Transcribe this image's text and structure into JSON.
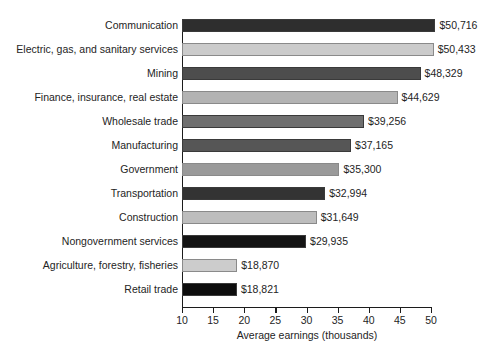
{
  "chart_data": {
    "type": "bar",
    "orientation": "horizontal",
    "title": "",
    "xlabel": "Average earnings (thousands)",
    "ylabel": "",
    "xlim": [
      10,
      50
    ],
    "xticks": [
      10,
      15,
      20,
      25,
      30,
      35,
      40,
      45,
      50
    ],
    "grid": false,
    "legend": null,
    "categories": [
      "Communication",
      "Electric, gas, and sanitary services",
      "Mining",
      "Finance, insurance, real estate",
      "Wholesale trade",
      "Manufacturing",
      "Government",
      "Transportation",
      "Construction",
      "Nongovernment services",
      "Agriculture, forestry, fisheries",
      "Retail trade"
    ],
    "values": [
      50716,
      50433,
      48329,
      44629,
      39256,
      37165,
      35300,
      32994,
      31649,
      29935,
      18870,
      18821
    ],
    "value_labels": [
      "$50,716",
      "$50,433",
      "$48,329",
      "$44,629",
      "$39,256",
      "$37,165",
      "$35,300",
      "$32,994",
      "$31,649",
      "$29,935",
      "$18,870",
      "$18,821"
    ],
    "bar_colors": [
      "#2e2e2e",
      "#cbcbcb",
      "#4d4d4d",
      "#b3b3b3",
      "#6f6f6f",
      "#565656",
      "#9a9a9a",
      "#333333",
      "#bdbdbd",
      "#141414",
      "#cccccc",
      "#0d0d0d"
    ]
  },
  "axis": {
    "tick_labels": [
      "10",
      "15",
      "20",
      "25",
      "30",
      "35",
      "40",
      "45",
      "50"
    ],
    "title": "Average earnings (thousands)"
  }
}
